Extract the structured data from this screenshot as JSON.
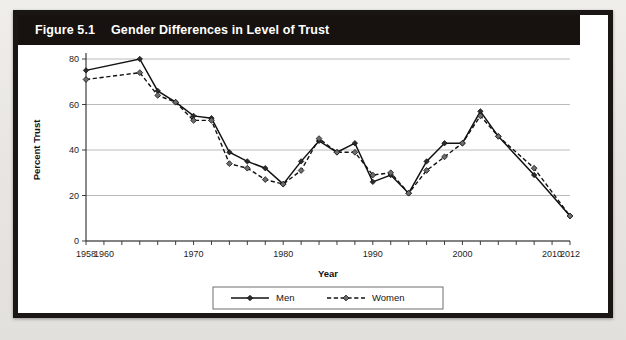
{
  "figure": {
    "number_label": "Figure 5.1",
    "title": "Gender Differences in Level of Trust"
  },
  "legend": {
    "men_label": "Men",
    "women_label": "Women"
  },
  "colors": {
    "banner_background": "#17120f",
    "banner_text": "#ffffff",
    "frame_border": "#1a1613",
    "plot_background": "#ffffff",
    "gridline": "#a9a9a9",
    "series_men": "#121212",
    "series_women": "#121212",
    "marker_men_fill": "#2b2b2b",
    "marker_women_fill": "#6d6d6d"
  },
  "chart_data": {
    "type": "line",
    "title": "Gender Differences in Level of Trust",
    "xlabel": "Year",
    "ylabel": "Percent Trust",
    "xlim": [
      1958,
      2012
    ],
    "ylim": [
      0,
      80
    ],
    "yticks": [
      0,
      20,
      40,
      60,
      80
    ],
    "ytick_labels": [
      "0",
      "20",
      "40",
      "60",
      "80"
    ],
    "xticks": [
      1958,
      1960,
      1962,
      1964,
      1966,
      1968,
      1970,
      1972,
      1974,
      1976,
      1978,
      1980,
      1982,
      1984,
      1986,
      1988,
      1990,
      1992,
      1994,
      1996,
      1998,
      2000,
      2002,
      2004,
      2006,
      2008,
      2010,
      2012
    ],
    "xtick_labels_shown": [
      "1958",
      "1960",
      "1970",
      "1980",
      "1990",
      "2000",
      "2010",
      "2012"
    ],
    "xtick_label_years": [
      1958,
      1960,
      1970,
      1980,
      1990,
      2000,
      2010,
      2012
    ],
    "grid": "horizontal",
    "legend_position": "bottom-center",
    "x": [
      1958,
      1964,
      1966,
      1968,
      1970,
      1972,
      1974,
      1976,
      1978,
      1980,
      1982,
      1984,
      1986,
      1988,
      1990,
      1992,
      1994,
      1996,
      1998,
      2000,
      2002,
      2004,
      2008,
      2012
    ],
    "series": [
      {
        "name": "Men",
        "style": "solid",
        "marker": "diamond",
        "values": [
          75,
          80,
          66,
          61,
          55,
          54,
          39,
          35,
          32,
          25,
          35,
          44,
          39,
          43,
          26,
          29,
          21,
          35,
          43,
          43,
          57,
          46,
          29,
          11
        ]
      },
      {
        "name": "Women",
        "style": "dashed",
        "marker": "diamond",
        "values": [
          71,
          74,
          64,
          61,
          53,
          53,
          34,
          32,
          27,
          25,
          31,
          45,
          39,
          39,
          29,
          30,
          21,
          31,
          37,
          43,
          55,
          46,
          32,
          11
        ]
      }
    ]
  }
}
